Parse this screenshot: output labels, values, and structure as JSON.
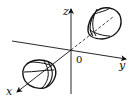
{
  "diagram": {
    "title": "",
    "axes": {
      "x_label": "x",
      "y_label": "y",
      "z_label": "z",
      "origin_label": "0"
    },
    "surfaces": [
      {
        "name": "sheet-positive-x-far",
        "position": "upper-right"
      },
      {
        "name": "sheet-near",
        "position": "lower-left"
      }
    ],
    "colors": {
      "stroke": "#111111",
      "background": "#ffffff"
    }
  }
}
